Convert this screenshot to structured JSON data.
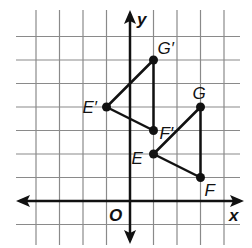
{
  "diagram": {
    "type": "coordinate-grid-transformation",
    "axes": {
      "x_label": "x",
      "y_label": "y",
      "origin_label": "O"
    },
    "grid": {
      "x_min": -4,
      "x_max": 4,
      "y_min": -1,
      "y_max": 7
    },
    "triangles": [
      {
        "name": "EFG",
        "vertices": [
          {
            "label": "E",
            "x": 1,
            "y": 2
          },
          {
            "label": "F",
            "x": 3,
            "y": 1
          },
          {
            "label": "G",
            "x": 3,
            "y": 4
          }
        ]
      },
      {
        "name": "E'F'G'",
        "vertices": [
          {
            "label": "E′",
            "x": -1,
            "y": 4
          },
          {
            "label": "F′",
            "x": 1,
            "y": 3
          },
          {
            "label": "G′",
            "x": 1,
            "y": 6
          }
        ]
      }
    ],
    "colors": {
      "grid": "#8a8a8a",
      "axis": "#111111",
      "stroke": "#111111"
    }
  }
}
